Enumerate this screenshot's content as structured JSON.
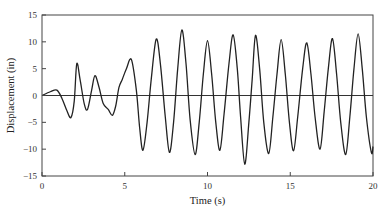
{
  "chart_data": {
    "type": "line",
    "title": "",
    "xlabel": "Time (s)",
    "ylabel": "Displacement (in)",
    "xlim": [
      0,
      20
    ],
    "ylim": [
      -15,
      15
    ],
    "xticks": [
      0,
      5,
      10,
      15,
      20
    ],
    "xtick_labels": [
      "0",
      "5",
      "10",
      "15",
      "20"
    ],
    "yticks": [
      15,
      10,
      5,
      0,
      -5,
      -10,
      -15
    ],
    "ytick_labels": [
      "15",
      "10",
      "5",
      "0",
      "−5",
      "−10",
      "−15"
    ],
    "zero_line": true,
    "grid": false,
    "legend": "none",
    "line_color": "#222222",
    "series": [
      {
        "name": "Displacement",
        "x": [
          0,
          0.5,
          0.9,
          1.2,
          1.5,
          1.75,
          1.95,
          2.1,
          2.3,
          2.55,
          2.75,
          3.0,
          3.2,
          3.45,
          3.7,
          4.0,
          4.25,
          4.45,
          4.65,
          4.85,
          5.1,
          5.4,
          5.7,
          5.9,
          6.1,
          6.35,
          6.6,
          6.9,
          7.15,
          7.45,
          7.7,
          7.95,
          8.2,
          8.45,
          8.7,
          8.95,
          9.25,
          9.5,
          9.75,
          10.0,
          10.25,
          10.5,
          10.75,
          11.0,
          11.3,
          11.55,
          11.8,
          12.0,
          12.25,
          12.5,
          12.7,
          12.9,
          13.15,
          13.4,
          13.7,
          13.95,
          14.2,
          14.45,
          14.7,
          14.95,
          15.2,
          15.45,
          15.75,
          16.0,
          16.25,
          16.5,
          16.8,
          17.05,
          17.3,
          17.55,
          17.8,
          18.05,
          18.35,
          18.6,
          18.85,
          19.1,
          19.35,
          19.6,
          19.9,
          20.0
        ],
        "y": [
          0,
          0.7,
          1.0,
          -0.5,
          -2.8,
          -4.1,
          -1.0,
          5.9,
          3.0,
          -1.5,
          -2.6,
          1.0,
          3.7,
          1.5,
          -1.5,
          -2.6,
          -3.7,
          -2.0,
          1.5,
          3.0,
          5.0,
          6.7,
          1.0,
          -6.0,
          -10.2,
          -5.0,
          3.0,
          10.5,
          6.0,
          -4.0,
          -10.6,
          -5.0,
          5.0,
          12.2,
          6.0,
          -4.5,
          -11.0,
          -5.0,
          4.0,
          10.2,
          4.0,
          -5.0,
          -10.2,
          -3.5,
          6.0,
          11.3,
          5.0,
          -4.0,
          -12.8,
          -5.0,
          3.0,
          11.2,
          5.0,
          -5.0,
          -10.8,
          -4.0,
          4.0,
          10.4,
          4.0,
          -5.0,
          -10.3,
          -4.0,
          5.0,
          9.8,
          4.0,
          -4.0,
          -10.0,
          -3.0,
          5.0,
          10.6,
          4.0,
          -5.0,
          -11.0,
          -4.0,
          5.0,
          11.5,
          5.0,
          -4.0,
          -10.6,
          -9.5
        ]
      }
    ]
  }
}
